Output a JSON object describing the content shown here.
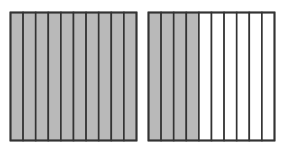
{
  "diagram": {
    "colors": {
      "shaded": "#b9b9b9",
      "unshaded": "#ffffff",
      "stroke": "#333333"
    },
    "squares": [
      {
        "name": "left-square",
        "total_parts": 10,
        "shaded_parts": 10
      },
      {
        "name": "right-square",
        "total_parts": 10,
        "shaded_parts": 4
      }
    ]
  }
}
